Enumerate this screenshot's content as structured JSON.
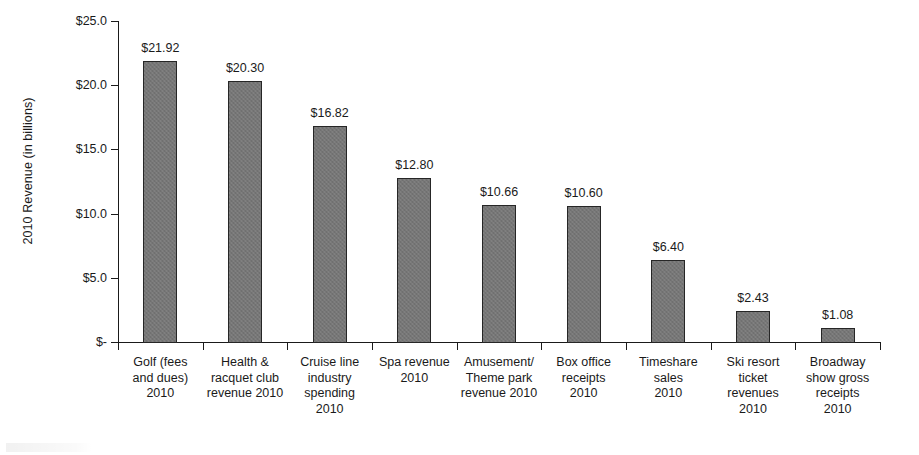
{
  "chart_data": {
    "type": "bar",
    "title": "",
    "subtitle": "",
    "xlabel": "",
    "ylabel": "2010 Revenue (in billions)",
    "ylim": [
      0,
      25
    ],
    "ytick_values": [
      25.0,
      20.0,
      15.0,
      10.0,
      5.0,
      0
    ],
    "ytick_labels": [
      "$25.0",
      "$20.0",
      "$15.0",
      "$10.0",
      "$5.0",
      "$-"
    ],
    "grid": false,
    "legend": null,
    "legend_position": "none",
    "bar_color": "#767676",
    "bar_edge_color": "#262626",
    "axis_color": "#1a1a1a",
    "categories": [
      "Golf (fees and dues) 2010",
      "Health & racquet club revenue 2010",
      "Cruise line industry spending 2010",
      "Spa revenue 2010",
      "Amusement/ Theme park revenue 2010",
      "Box office receipts 2010",
      "Timeshare sales 2010",
      "Ski resort ticket revenues 2010",
      "Broadway show gross receipts 2010"
    ],
    "category_label_lines": [
      [
        "Golf (fees",
        "and dues)",
        "2010"
      ],
      [
        "Health &",
        "racquet club",
        "revenue 2010"
      ],
      [
        "Cruise line",
        "industry",
        "spending",
        "2010"
      ],
      [
        "Spa revenue",
        "2010"
      ],
      [
        "Amusement/",
        "Theme park",
        "revenue 2010"
      ],
      [
        "Box office",
        "receipts",
        "2010"
      ],
      [
        "Timeshare",
        "sales",
        "2010"
      ],
      [
        "Ski resort",
        "ticket",
        "revenues",
        "2010"
      ],
      [
        "Broadway",
        "show gross",
        "receipts",
        "2010"
      ]
    ],
    "values": [
      21.92,
      20.3,
      16.82,
      12.8,
      10.66,
      10.6,
      6.4,
      2.43,
      1.08
    ],
    "data_labels": [
      "$21.92",
      "$20.30",
      "$16.82",
      "$12.80",
      "$10.66",
      "$10.60",
      "$6.40",
      "$2.43",
      "$1.08"
    ]
  }
}
